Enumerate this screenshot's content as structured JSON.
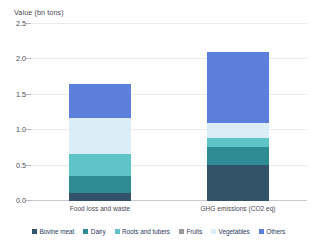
{
  "chart_data": {
    "type": "bar",
    "title": "Value (bn tons)",
    "subtitle": "",
    "xlabel": "",
    "ylabel": "Value (bn tons)",
    "stacked": true,
    "grid": true,
    "legend_position": "bottom",
    "ylim": [
      0,
      2.5
    ],
    "yticks": [
      0.0,
      0.5,
      1.0,
      1.5,
      2.0,
      2.5
    ],
    "ytick_labels": [
      "0.0",
      "0.5",
      "1.0",
      "1.5",
      "2.0",
      "2.5"
    ],
    "categories": [
      "Food loss and waste",
      "GHG emissions (CO2 eq)"
    ],
    "series": [
      {
        "name": "Bovine meat",
        "color": "#33536b",
        "values": [
          0.12,
          0.51
        ]
      },
      {
        "name": "Dairy",
        "color": "#2f8c94",
        "values": [
          0.23,
          0.26
        ]
      },
      {
        "name": "Roots and tubers",
        "color": "#5fc4c8",
        "values": [
          0.32,
          0.12
        ]
      },
      {
        "name": "Fruits",
        "color": "#9e9a9a",
        "values": [
          0.0,
          0.0
        ]
      },
      {
        "name": "Vegetables",
        "color": "#dbeef8",
        "values": [
          0.51,
          0.21
        ]
      },
      {
        "name": "Others",
        "color": "#5b7fdb",
        "values": [
          0.47,
          1.0
        ]
      }
    ],
    "bar_totals": [
      1.66,
      2.1
    ],
    "annotations": []
  },
  "legend": {
    "items": [
      {
        "label": "Bovine meat"
      },
      {
        "label": "Dairy"
      },
      {
        "label": "Roots and tubers"
      },
      {
        "label": "Fruits"
      },
      {
        "label": "Vegetables"
      },
      {
        "label": "Others"
      }
    ]
  }
}
